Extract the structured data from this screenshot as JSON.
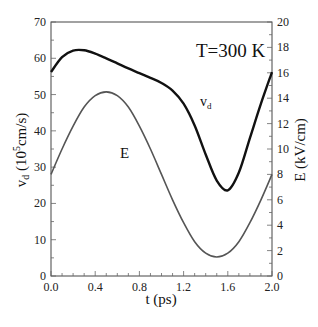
{
  "chart_data": {
    "type": "line",
    "title": "",
    "annotation": "T=300 K",
    "xlabel": "t (ps)",
    "ylabel_left": "v_d (10^5 cm/s)",
    "ylabel_left_parts": {
      "main": "v",
      "sub": "d",
      "rest_pre": " (10",
      "sup": "5",
      "rest_post": "cm/s)"
    },
    "ylabel_right": "E (kV/cm)",
    "xlim": [
      0.0,
      2.0
    ],
    "ylim_left": [
      0,
      70
    ],
    "ylim_right": [
      0,
      20
    ],
    "x_ticks": [
      "0.0",
      "0.4",
      "0.8",
      "1.2",
      "1.6",
      "2.0"
    ],
    "y_left_ticks": [
      "0",
      "10",
      "20",
      "30",
      "40",
      "50",
      "60",
      "70"
    ],
    "y_right_ticks": [
      "0",
      "2",
      "4",
      "6",
      "8",
      "10",
      "12",
      "14",
      "16",
      "18",
      "20"
    ],
    "grid": false,
    "series": [
      {
        "name": "v_d",
        "label": "v",
        "label_sub": "d",
        "axis": "left",
        "color": "#111111",
        "x": [
          0.0,
          0.1,
          0.2,
          0.3,
          0.4,
          0.5,
          0.6,
          0.7,
          0.8,
          0.9,
          1.0,
          1.1,
          1.2,
          1.3,
          1.4,
          1.5,
          1.6,
          1.7,
          1.8,
          1.9,
          2.0
        ],
        "values": [
          56.2,
          60.3,
          62.1,
          62.2,
          61.3,
          60.0,
          58.6,
          57.2,
          55.9,
          54.6,
          53.2,
          51.1,
          47.5,
          41.5,
          33.5,
          26.3,
          23.6,
          28.5,
          38.0,
          47.5,
          56.2
        ]
      },
      {
        "name": "E",
        "label": "E",
        "axis": "right",
        "color": "#555555",
        "x": [
          0.0,
          0.1,
          0.2,
          0.3,
          0.4,
          0.5,
          0.6,
          0.7,
          0.8,
          0.9,
          1.0,
          1.1,
          1.2,
          1.3,
          1.4,
          1.5,
          1.6,
          1.7,
          1.8,
          1.9,
          2.0
        ],
        "values": [
          8.0,
          10.0,
          11.8,
          13.3,
          14.2,
          14.5,
          14.2,
          13.3,
          11.8,
          10.0,
          8.0,
          6.0,
          4.2,
          2.7,
          1.8,
          1.5,
          1.8,
          2.7,
          4.2,
          6.0,
          8.0
        ]
      }
    ]
  }
}
